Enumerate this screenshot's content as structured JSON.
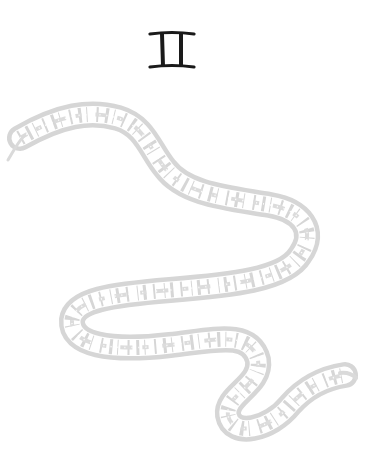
{
  "illustration": {
    "symbol": "II",
    "symbol_meaning": "gemini-numeral-glyph",
    "symbol_color": "#1a1a1a",
    "ribbon_color": "#d4d4d4",
    "ribbon_pattern_color": "#ffffff",
    "background": "#ffffff"
  }
}
